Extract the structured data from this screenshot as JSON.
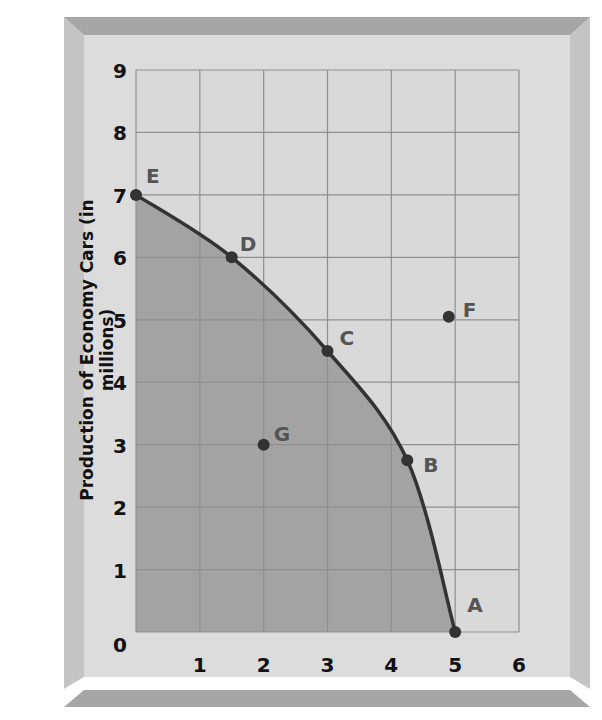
{
  "chart_data": {
    "type": "line",
    "title": "",
    "xlabel": "",
    "ylabel": "Production of Economy Cars (in millions)",
    "xlim": [
      0,
      6
    ],
    "ylim": [
      0,
      9
    ],
    "x_ticks": [
      "1",
      "2",
      "3",
      "4",
      "5",
      "6"
    ],
    "y_ticks": [
      "0",
      "1",
      "2",
      "3",
      "4",
      "5",
      "6",
      "7",
      "8",
      "9"
    ],
    "grid": true,
    "legend": null,
    "series": [
      {
        "name": "Production possibilities frontier",
        "type": "curve",
        "points": [
          {
            "label": "E",
            "x": 0,
            "y": 7
          },
          {
            "label": "D",
            "x": 1.5,
            "y": 6
          },
          {
            "label": "C",
            "x": 3,
            "y": 4.5
          },
          {
            "label": "B",
            "x": 4.25,
            "y": 2.75
          },
          {
            "label": "A",
            "x": 5,
            "y": 0
          }
        ],
        "shaded_below": true
      },
      {
        "name": "Other points",
        "type": "scatter",
        "points": [
          {
            "label": "F",
            "x": 4.9,
            "y": 5.05
          },
          {
            "label": "G",
            "x": 2,
            "y": 3
          }
        ]
      }
    ],
    "colors": {
      "frame_outer": "#a6a6a6",
      "frame_inner": "#dcdcdc",
      "plot_bg": "#d9d9d9",
      "shaded_region": "#a3a3a3",
      "grid": "#8f8f8f",
      "curve": "#333333",
      "point": "#333333",
      "point_label": "#555555",
      "tick_label": "#111111"
    }
  }
}
